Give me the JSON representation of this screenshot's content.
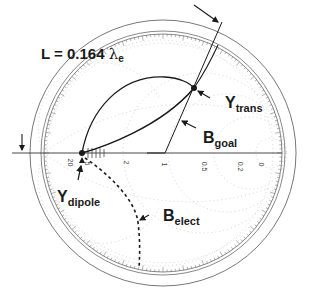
{
  "diagram": {
    "type": "smith-chart",
    "title": {
      "prefix": "L = 0.164 ",
      "lambda": "λ",
      "subscript": "e"
    },
    "labels": {
      "y_trans": {
        "main": "Y",
        "sub": "trans"
      },
      "b_goal": {
        "main": "B",
        "sub": "goal"
      },
      "y_dipole": {
        "main": "Y",
        "sub": "dipole"
      },
      "b_elect": {
        "main": "B",
        "sub": "elect"
      }
    },
    "axis_ticks": [
      "20",
      "5",
      "2",
      "1",
      "0.5",
      "0.2",
      "0"
    ],
    "colors": {
      "ink": "#1a1a1a",
      "grid": "#9a9a9a",
      "background": "#ffffff"
    }
  }
}
